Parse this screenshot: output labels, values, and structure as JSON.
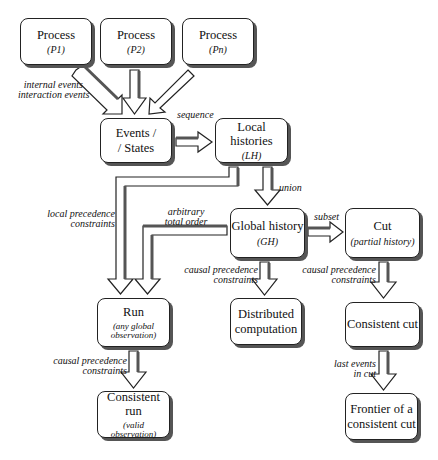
{
  "diagram": {
    "nodes": {
      "p1": {
        "title": "Process",
        "sub": "(P1)"
      },
      "p2": {
        "title": "Process",
        "sub": "(P2)"
      },
      "pn": {
        "title": "Process",
        "sub": "(Pn)"
      },
      "events": {
        "title": "Events /",
        "title2": "/ States"
      },
      "lh": {
        "title": "Local histories",
        "sub": "(LH)"
      },
      "gh": {
        "title": "Global history",
        "sub": "(GH)"
      },
      "cut": {
        "title": "Cut",
        "sub": "(partial history)"
      },
      "run": {
        "title": "Run",
        "sub": "(any global",
        "sub2": "observation)"
      },
      "dc": {
        "title": "Distributed",
        "title2": "computation"
      },
      "ccut": {
        "title": "Consistent cut"
      },
      "crun": {
        "title": "Consistent run",
        "sub": "(valid",
        "sub2": "observation)"
      },
      "frontier": {
        "title": "Frontier of a",
        "title2": "consistent cut"
      }
    },
    "edge_labels": {
      "internal_events": "internal events",
      "interaction_events": "interaction events",
      "sequence": "sequence",
      "union": "union",
      "local_precedence_1": "local precedence",
      "local_precedence_2": "constraints",
      "arbitrary_1": "arbitrary",
      "arbitrary_2": "total order",
      "subset": "subset",
      "causal_gh_1": "causal precedence",
      "causal_gh_2": "constraints",
      "causal_cut_1": "causal precedence",
      "causal_cut_2": "constraints",
      "causal_run_1": "causal precedence",
      "causal_run_2": "constraints",
      "last_events_1": "last events",
      "last_events_2": "in cut"
    },
    "edges": [
      {
        "from": "p1",
        "to": "events",
        "label": "internal events / interaction events"
      },
      {
        "from": "p2",
        "to": "events"
      },
      {
        "from": "pn",
        "to": "events"
      },
      {
        "from": "events",
        "to": "lh",
        "label": "sequence"
      },
      {
        "from": "lh",
        "to": "gh",
        "label": "union"
      },
      {
        "from": "lh",
        "to": "run",
        "label": "local precedence constraints"
      },
      {
        "from": "gh",
        "to": "run",
        "label": "arbitrary total order"
      },
      {
        "from": "gh",
        "to": "cut",
        "label": "subset"
      },
      {
        "from": "gh",
        "to": "dc",
        "label": "causal precedence constraints"
      },
      {
        "from": "cut",
        "to": "ccut",
        "label": "causal precedence constraints"
      },
      {
        "from": "run",
        "to": "crun",
        "label": "causal precedence constraints"
      },
      {
        "from": "ccut",
        "to": "frontier",
        "label": "last events in cut"
      }
    ]
  }
}
